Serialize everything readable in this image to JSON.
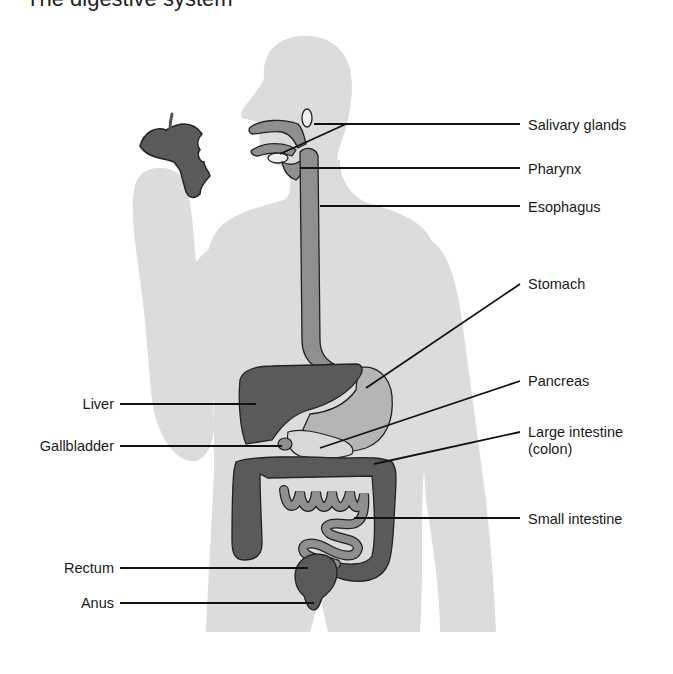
{
  "title": "The digestive system",
  "colors": {
    "body": "#dcdcdc",
    "organ_dark": "#5a5a5a",
    "organ_mid": "#8f8f8f",
    "organ_light": "#b5b5b5",
    "leader_line": "#111111",
    "text": "#1a1a1a"
  },
  "labels": {
    "right": [
      {
        "id": "salivary-glands",
        "text": "Salivary glands"
      },
      {
        "id": "pharynx",
        "text": "Pharynx"
      },
      {
        "id": "esophagus",
        "text": "Esophagus"
      },
      {
        "id": "stomach",
        "text": "Stomach"
      },
      {
        "id": "pancreas",
        "text": "Pancreas"
      },
      {
        "id": "large-intestine",
        "text": "Large intestine",
        "subtext": "(colon)"
      },
      {
        "id": "small-intestine",
        "text": "Small intestine"
      }
    ],
    "left": [
      {
        "id": "liver",
        "text": "Liver"
      },
      {
        "id": "gallbladder",
        "text": "Gallbladder"
      },
      {
        "id": "rectum",
        "text": "Rectum"
      },
      {
        "id": "anus",
        "text": "Anus"
      }
    ]
  }
}
